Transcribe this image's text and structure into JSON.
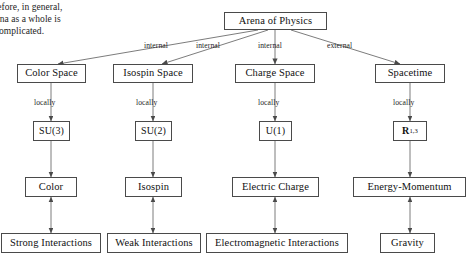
{
  "page": {
    "body_text": {
      "line1": "refore, in general,",
      "line2": "arena as a whole is",
      "line3": "e complicated."
    }
  },
  "diagram": {
    "title_node": {
      "label": "Arena of Physics"
    },
    "edge_labels": {
      "to_color": "internal",
      "to_isospin": "internal",
      "to_charge": "internal",
      "to_spacetime": "external",
      "locally_1": "locally",
      "locally_2": "locally",
      "locally_3": "locally",
      "locally_4": "locally"
    },
    "columns": [
      {
        "space": "Color Space",
        "group": "SU(3)",
        "group_base": "SU(3)",
        "charge": "Color",
        "interaction": "Strong Interactions"
      },
      {
        "space": "Isospin Space",
        "group": "SU(2)",
        "group_base": "SU(2)",
        "charge": "Isospin",
        "interaction": "Weak Interactions"
      },
      {
        "space": "Charge Space",
        "group": "U(1)",
        "group_base": "U(1)",
        "charge": "Electric Charge",
        "interaction": "Electromagnetic Interactions"
      },
      {
        "space": "Spacetime",
        "group": "R",
        "group_base": "R",
        "group_superscript": "1,3",
        "charge": "Energy-Momentum",
        "interaction": "Gravity"
      }
    ]
  },
  "colors": {
    "stroke": "#4a4a4a",
    "line": "#5a5a5a",
    "text": "#111111",
    "background": "#ffffff"
  }
}
